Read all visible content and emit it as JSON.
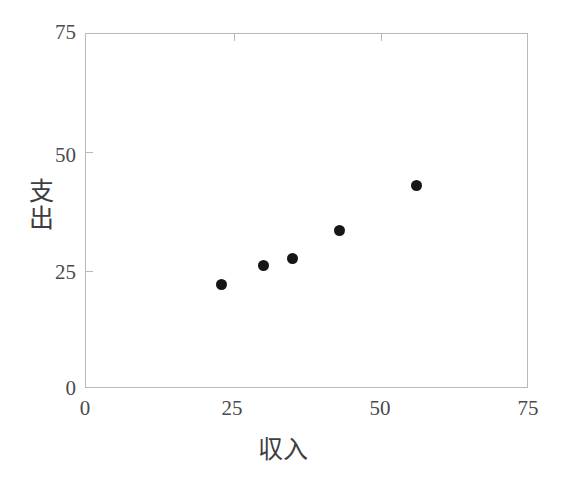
{
  "chart_data": {
    "type": "scatter",
    "title": "",
    "subtitle": "",
    "xlabel": "収入",
    "ylabel": "支出",
    "ylabel_chars": [
      "支",
      "出"
    ],
    "xlim": [
      0,
      75
    ],
    "ylim": [
      0,
      75
    ],
    "xticks": [
      0,
      25,
      50,
      75
    ],
    "yticks": [
      0,
      25,
      50,
      75
    ],
    "xtick_labels": [
      "0",
      "25",
      "50",
      "75"
    ],
    "ytick_labels": [
      "0",
      "25",
      "50",
      "75"
    ],
    "grid": false,
    "legend": null,
    "marker": {
      "shape": "circle",
      "color": "#161616",
      "size_px": 11
    },
    "points": [
      {
        "x": 23,
        "y": 22
      },
      {
        "x": 30,
        "y": 26
      },
      {
        "x": 35,
        "y": 27.5
      },
      {
        "x": 43,
        "y": 33.5
      },
      {
        "x": 56,
        "y": 43
      }
    ],
    "frame_color": "#b9b9bd",
    "background": "#ffffff"
  }
}
